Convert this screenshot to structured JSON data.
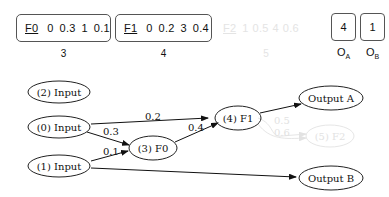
{
  "genome": {
    "genes": [
      {
        "name": "F0",
        "values": [
          "0",
          "0.3",
          "1",
          "0.1"
        ],
        "index": "3",
        "faded": false
      },
      {
        "name": "F1",
        "values": [
          "0",
          "0.2",
          "3",
          "0.4"
        ],
        "index": "4",
        "faded": false
      },
      {
        "name": "F2",
        "values": [
          "1",
          "0.5",
          "4",
          "0.6"
        ],
        "index": "5",
        "faded": true
      }
    ],
    "outputs": [
      {
        "value": "4",
        "label": "O",
        "sub": "A"
      },
      {
        "value": "1",
        "label": "O",
        "sub": "B"
      }
    ]
  },
  "graph": {
    "nodes": {
      "input2": "(2) Input",
      "input0": "(0) Input",
      "input1": "(1) Input",
      "f0": "(3) F0",
      "f1": "(4) F1",
      "f2": "(5) F2",
      "outA": "Output A",
      "outB": "Output B"
    },
    "edges": {
      "in0_f1": "0.2",
      "in0_f0": "0.3",
      "in1_f0": "0.1",
      "f0_f1": "0.4",
      "f2_a": "0.5",
      "f2_b": "0.6"
    },
    "colors": {
      "active": "#111111",
      "inactive": "#e2e2e2"
    }
  }
}
